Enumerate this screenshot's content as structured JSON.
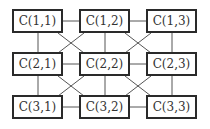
{
  "diagram": {
    "type": "mesh-grid",
    "nodes": [
      {
        "id": "1,1",
        "label": "C(1,1)",
        "row": 1,
        "col": 1
      },
      {
        "id": "1,2",
        "label": "C(1,2)",
        "row": 1,
        "col": 2
      },
      {
        "id": "1,3",
        "label": "C(1,3)",
        "row": 1,
        "col": 3
      },
      {
        "id": "2,1",
        "label": "C(2,1)",
        "row": 2,
        "col": 1
      },
      {
        "id": "2,2",
        "label": "C(2,2)",
        "row": 2,
        "col": 2
      },
      {
        "id": "2,3",
        "label": "C(2,3)",
        "row": 2,
        "col": 3
      },
      {
        "id": "3,1",
        "label": "C(3,1)",
        "row": 3,
        "col": 1
      },
      {
        "id": "3,2",
        "label": "C(3,2)",
        "row": 3,
        "col": 2
      },
      {
        "id": "3,3",
        "label": "C(3,3)",
        "row": 3,
        "col": 3
      }
    ],
    "edges": {
      "horizontal": [
        "1,1-1,2",
        "1,2-1,3",
        "2,1-2,2",
        "2,2-2,3",
        "3,1-3,2",
        "3,2-3,3"
      ],
      "vertical": [
        "1,1-2,1",
        "1,2-2,2",
        "1,3-2,3",
        "2,1-3,1",
        "2,2-3,2",
        "2,3-3,3"
      ],
      "diagonal": [
        "1,1-2,2",
        "1,2-2,1",
        "1,2-2,3",
        "1,3-2,2",
        "2,1-3,2",
        "2,2-3,1",
        "2,2-3,3",
        "2,3-3,2"
      ]
    },
    "colors": {
      "border": "#2a2a2a",
      "text": "#333333",
      "line": "#555555",
      "background": "#ffffff"
    }
  }
}
